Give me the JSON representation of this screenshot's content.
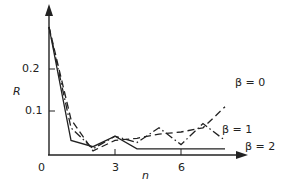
{
  "chart_data": {
    "type": "line",
    "title": "",
    "xlabel": "n",
    "ylabel": "R",
    "x": [
      0,
      1,
      2,
      3,
      4,
      5,
      6,
      7,
      8
    ],
    "xticks": [
      0,
      3,
      6
    ],
    "xtick_labels": [
      "0",
      "3",
      "6"
    ],
    "yticks": [
      0.1,
      0.2
    ],
    "ytick_labels": [
      "0.1",
      "0.2"
    ],
    "xlim": [
      0,
      8.9
    ],
    "ylim": [
      0,
      0.32
    ],
    "grid": false,
    "legend_position": "inline-right",
    "series": [
      {
        "name": "β = 0",
        "style": "dashed",
        "values": [
          0.3,
          0.08,
          0.005,
          0.03,
          0.035,
          0.045,
          0.05,
          0.06,
          0.11
        ]
      },
      {
        "name": "β = 1",
        "style": "dash-dot",
        "values": [
          0.3,
          0.06,
          0.01,
          0.04,
          0.025,
          0.06,
          0.02,
          0.07,
          0.03
        ]
      },
      {
        "name": "β = 2",
        "style": "solid",
        "values": [
          0.3,
          0.03,
          0.015,
          0.04,
          0.01,
          0.01,
          0.01,
          0.01,
          0.01
        ]
      }
    ]
  },
  "labels": {
    "ylabel": "R",
    "xlabel": "n",
    "origin": "0",
    "xtick_3": "3",
    "xtick_6": "6",
    "ytick_01": "0.1",
    "ytick_02": "0.2",
    "beta0": "β = 0",
    "beta1": "β = 1",
    "beta2": "β = 2"
  }
}
